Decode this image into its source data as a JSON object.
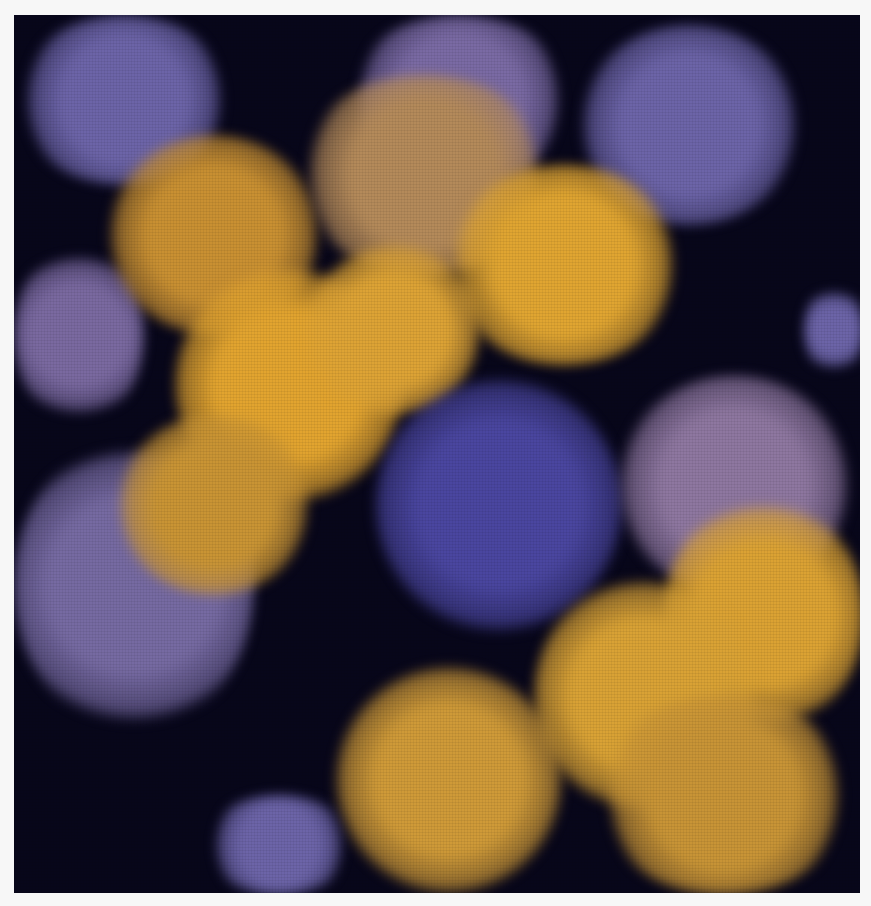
{
  "image": {
    "subject": "fractal",
    "description": "Julia-set style fractal with gold and purple bulbous lobes along a diagonal, black dendritic filaments, blue central rosette",
    "colors": {
      "background_border": "#f7f7f7",
      "void": "#07061a",
      "gold": "#e0a531",
      "gold_dark": "#b9822a",
      "purple": "#6c64a8",
      "blue_center": "#4a46a0",
      "mauve": "#8a6f9e"
    },
    "blobs": [
      {
        "x": 0,
        "y": 0,
        "w": 220,
        "h": 170,
        "c": "#6c64a8"
      },
      {
        "x": 330,
        "y": 0,
        "w": 230,
        "h": 170,
        "c": "#7a6aa4"
      },
      {
        "x": 560,
        "y": 10,
        "w": 230,
        "h": 200,
        "c": "#6c64a8"
      },
      {
        "x": 0,
        "y": 230,
        "w": 130,
        "h": 180,
        "c": "#7a69a0"
      },
      {
        "x": 790,
        "y": 270,
        "w": 60,
        "h": 90,
        "c": "#6c64a8"
      },
      {
        "x": 90,
        "y": 120,
        "w": 220,
        "h": 200,
        "c": "#c99032"
      },
      {
        "x": 280,
        "y": 60,
        "w": 260,
        "h": 200,
        "c": "#b48a5a"
      },
      {
        "x": 430,
        "y": 150,
        "w": 240,
        "h": 200,
        "c": "#e0a531"
      },
      {
        "x": 160,
        "y": 250,
        "w": 230,
        "h": 240,
        "c": "#e2a42f"
      },
      {
        "x": 290,
        "y": 230,
        "w": 180,
        "h": 170,
        "c": "#dda335"
      },
      {
        "x": 0,
        "y": 420,
        "w": 240,
        "h": 300,
        "c": "#766aa2"
      },
      {
        "x": 100,
        "y": 400,
        "w": 200,
        "h": 180,
        "c": "#c99434"
      },
      {
        "x": 360,
        "y": 360,
        "w": 250,
        "h": 260,
        "c": "#4a46a0"
      },
      {
        "x": 600,
        "y": 360,
        "w": 240,
        "h": 220,
        "c": "#8e77a0"
      },
      {
        "x": 650,
        "y": 480,
        "w": 200,
        "h": 240,
        "c": "#dba233"
      },
      {
        "x": 520,
        "y": 560,
        "w": 220,
        "h": 240,
        "c": "#d9a235"
      },
      {
        "x": 320,
        "y": 650,
        "w": 230,
        "h": 230,
        "c": "#cf9a38"
      },
      {
        "x": 580,
        "y": 680,
        "w": 260,
        "h": 200,
        "c": "#c89436"
      },
      {
        "x": 190,
        "y": 780,
        "w": 150,
        "h": 100,
        "c": "#6c64a8"
      }
    ]
  }
}
